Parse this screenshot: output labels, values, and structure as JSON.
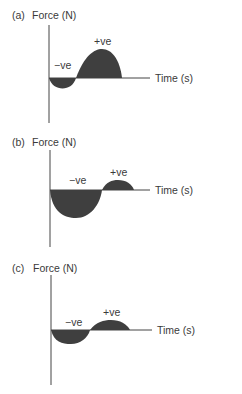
{
  "panels": [
    {
      "id": "a",
      "label": "(a)",
      "y_axis_label": "Force (N)",
      "x_axis_label": "Time (s)",
      "negative_label": "−ve",
      "positive_label": "+ve",
      "description": "Small negative impulse followed by large positive impulse"
    },
    {
      "id": "b",
      "label": "(b)",
      "y_axis_label": "Force (N)",
      "x_axis_label": "Time (s)",
      "negative_label": "−ve",
      "positive_label": "+ve",
      "description": "Large negative impulse followed by small positive impulse"
    },
    {
      "id": "c",
      "label": "(c)",
      "y_axis_label": "Force (N)",
      "x_axis_label": "Time (s)",
      "negative_label": "−ve",
      "positive_label": "+ve",
      "description": "Roughly equal negative and positive impulses"
    }
  ],
  "colors": {
    "fill": "#3f3f3f",
    "axis": "#444444",
    "text": "#3a3a3a"
  }
}
